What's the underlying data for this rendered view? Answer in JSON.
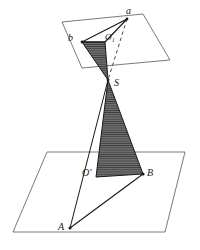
{
  "figure": {
    "colors": {
      "plane_stroke": "#6b6b6b",
      "solid_stroke": "#1a1a1a",
      "dashed_stroke": "#4a4a4a",
      "shade_fill": "#6e6e6e",
      "hatch_line": "#3c3c3c",
      "background": "#ffffff",
      "label_color": "#1a1a1a"
    },
    "labels": {
      "a": "a",
      "b": "b",
      "o1": "O₁",
      "s": "S",
      "o_prime": "O'",
      "B": "B",
      "A": "A"
    },
    "upper_plane": {
      "name": "upper-plane",
      "points": "62,22 143,14 170,60 82,68"
    },
    "lower_plane": {
      "name": "lower-plane",
      "points": "47,152 185,152 165,232 13,232"
    },
    "upper_triangle": {
      "name": "upper-shaded-triangle",
      "points": "82,42 105,42 108,80"
    },
    "upper_edges": {
      "b_to_a": "82,42 127,19",
      "a_to_o1": "127,19 105,42",
      "b_to_o1": "82,42 105,42"
    },
    "lower_triangle": {
      "name": "lower-shaded-triangle",
      "points": "108,80 96,177 143,174"
    },
    "lines": {
      "s_to_A": "108,80 70,228",
      "A_to_B": "70,228 143,174",
      "dashed_a_to_s": "127,19 108,80"
    },
    "points": {
      "a": [
        127,
        19
      ],
      "b": [
        82,
        42
      ],
      "o1": [
        105,
        42
      ],
      "s": [
        108,
        80
      ],
      "o_prime": [
        96,
        177
      ],
      "B": [
        143,
        174
      ],
      "A": [
        70,
        228
      ]
    }
  }
}
